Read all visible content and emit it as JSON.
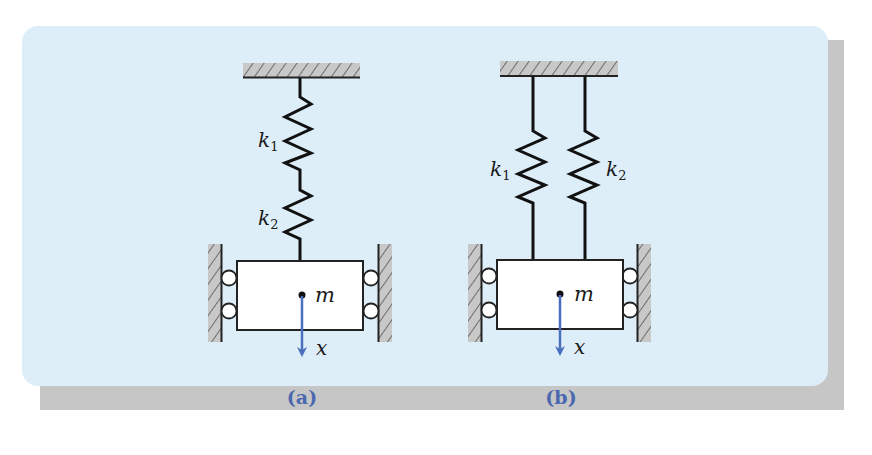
{
  "figure": {
    "background_color": "#deeef9",
    "shadow_color": "#c6c6c6",
    "ground_fill": "#c8c8c8",
    "arrow_color": "#4a6fbf",
    "caption_color": "#4a67b0"
  },
  "panel_a": {
    "caption": "(a)",
    "configuration": "springs in series",
    "springs": [
      {
        "symbol": "k",
        "subscript": "1"
      },
      {
        "symbol": "k",
        "subscript": "2"
      }
    ],
    "mass_label": "m",
    "displacement_label": "x"
  },
  "panel_b": {
    "caption": "(b)",
    "configuration": "springs in parallel",
    "springs": [
      {
        "symbol": "k",
        "subscript": "1"
      },
      {
        "symbol": "k",
        "subscript": "2"
      }
    ],
    "mass_label": "m",
    "displacement_label": "x"
  }
}
